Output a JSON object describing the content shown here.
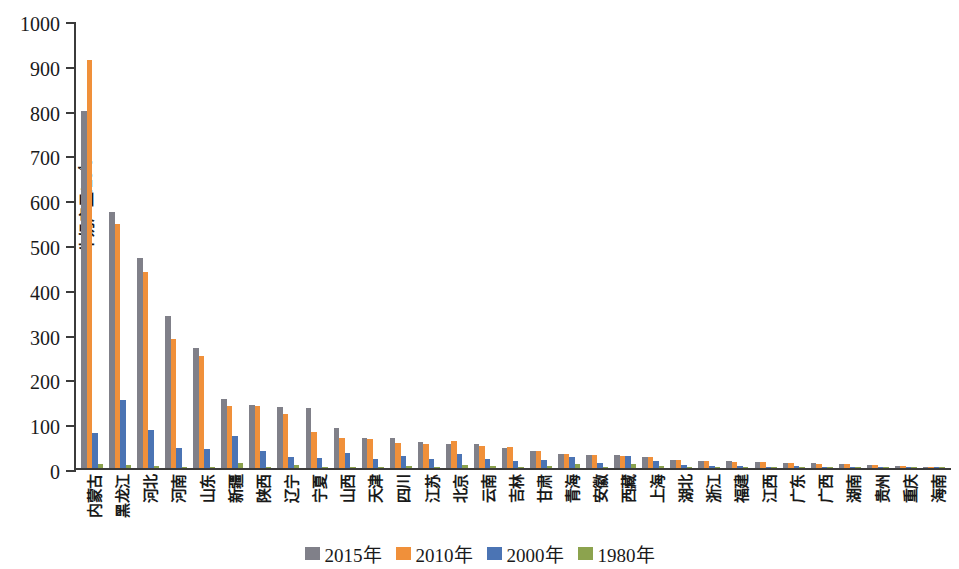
{
  "chart_data": {
    "type": "bar",
    "title": "",
    "subtitle": "",
    "xlabel": "",
    "ylabel": "牛奶产量/10⁴t",
    "ylabel_base": "牛奶产量/10",
    "ylabel_sup": "4",
    "ylabel_unit": "t",
    "ylim": [
      0,
      1000
    ],
    "yticks": [
      0,
      100,
      200,
      300,
      400,
      500,
      600,
      700,
      800,
      900,
      1000
    ],
    "grid": false,
    "legend_position": "bottom-center",
    "categories": [
      "内蒙古",
      "黑龙江",
      "河北",
      "河南",
      "山东",
      "新疆",
      "陕西",
      "辽宁",
      "宁夏",
      "山西",
      "天津",
      "四川",
      "江苏",
      "北京",
      "云南",
      "吉林",
      "甘肃",
      "青海",
      "安徽",
      "西藏",
      "上海",
      "湖北",
      "浙江",
      "福建",
      "江西",
      "广东",
      "广西",
      "湖南",
      "贵州",
      "重庆",
      "海南"
    ],
    "series": [
      {
        "name": "2015年",
        "color": "#808089",
        "values": [
          797,
          571,
          469,
          339,
          269,
          153,
          141,
          137,
          134,
          90,
          68,
          68,
          57,
          54,
          54,
          45,
          39,
          32,
          30,
          28,
          24,
          18,
          16,
          15,
          14,
          12,
          11,
          9,
          7,
          5,
          2
        ]
      },
      {
        "name": "2010年",
        "color": "#f0903a",
        "values": [
          911,
          545,
          437,
          288,
          250,
          138,
          138,
          120,
          81,
          67,
          64,
          56,
          53,
          61,
          49,
          46,
          39,
          31,
          30,
          26,
          25,
          17,
          15,
          14,
          13,
          11,
          10,
          8,
          6,
          5,
          2
        ]
      },
      {
        "name": "2000年",
        "color": "#4b74b4",
        "values": [
          79,
          152,
          84,
          45,
          42,
          72,
          39,
          25,
          22,
          34,
          20,
          27,
          20,
          31,
          21,
          16,
          17,
          25,
          12,
          26,
          15,
          6,
          5,
          4,
          3,
          4,
          3,
          3,
          2,
          2,
          1
        ]
      },
      {
        "name": "1980年",
        "color": "#8ca34e",
        "values": [
          9,
          7,
          4,
          3,
          3,
          11,
          3,
          6,
          2,
          2,
          3,
          4,
          3,
          6,
          4,
          3,
          5,
          9,
          2,
          8,
          4,
          1,
          1,
          1,
          1,
          1,
          1,
          1,
          0.5,
          0.5,
          0.2
        ]
      }
    ]
  },
  "legend": {
    "items": [
      {
        "label": "2015年",
        "color": "#808089"
      },
      {
        "label": "2010年",
        "color": "#f0903a"
      },
      {
        "label": "2000年",
        "color": "#4b74b4"
      },
      {
        "label": "1980年",
        "color": "#8ca34e"
      }
    ]
  }
}
